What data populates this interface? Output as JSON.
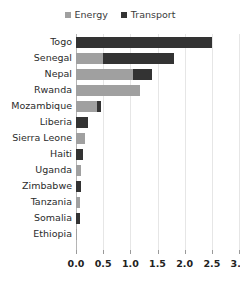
{
  "chart_data": {
    "type": "bar",
    "orientation": "horizontal",
    "stacked": true,
    "title": "",
    "subtitle": "",
    "xlabel": "",
    "ylabel": "",
    "xlim": [
      0.0,
      3.0
    ],
    "xticks": [
      "0.0",
      "0.5",
      "1.0",
      "1.5",
      "2.0",
      "2.5",
      "3.0"
    ],
    "xtick_values": [
      0.0,
      0.5,
      1.0,
      1.5,
      2.0,
      2.5,
      3.0
    ],
    "grid": true,
    "legend_position": "top-center",
    "categories": [
      "Togo",
      "Senegal",
      "Nepal",
      "Rwanda",
      "Mozambique",
      "Liberia",
      "Sierra Leone",
      "Haiti",
      "Uganda",
      "Zimbabwe",
      "Tanzania",
      "Somalia",
      "Ethiopia"
    ],
    "series": [
      {
        "name": "Energy",
        "color": "#a0a0a0",
        "values": [
          0.0,
          0.5,
          1.05,
          1.17,
          0.39,
          0.0,
          0.17,
          0.0,
          0.1,
          0.0,
          0.08,
          0.0,
          0.02
        ]
      },
      {
        "name": "Transport",
        "color": "#333333",
        "values": [
          2.5,
          1.3,
          0.35,
          0.0,
          0.07,
          0.22,
          0.0,
          0.12,
          0.0,
          0.1,
          0.0,
          0.07,
          0.0
        ]
      }
    ],
    "totals": [
      2.5,
      1.8,
      1.4,
      1.17,
      0.46,
      0.22,
      0.17,
      0.12,
      0.1,
      0.1,
      0.08,
      0.07,
      0.02
    ]
  },
  "legend": {
    "items": [
      {
        "label": "Energy",
        "color": "#a0a0a0"
      },
      {
        "label": "Transport",
        "color": "#333333"
      }
    ]
  },
  "colors": {
    "energy": "#a0a0a0",
    "transport": "#333333",
    "gridline": "#e6e6e6",
    "axis": "#b5b5b5",
    "text": "#2b2b2b",
    "background": "#ffffff"
  }
}
